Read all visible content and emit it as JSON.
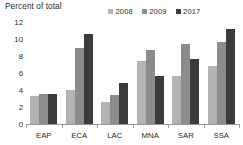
{
  "chart_data": {
    "type": "bar",
    "title": "",
    "ylabel": "Percent of total",
    "xlabel": "",
    "ylim": [
      0,
      12
    ],
    "yticks": [
      0,
      2,
      4,
      6,
      8,
      10,
      12
    ],
    "grid": false,
    "legend_position": "top-right",
    "categories": [
      "EAP",
      "ECA",
      "LAC",
      "MNA",
      "SAR",
      "SSA"
    ],
    "series": [
      {
        "name": "2008",
        "color": "#b3b3b3",
        "values": [
          3.3,
          4.0,
          2.6,
          7.4,
          5.7,
          6.8
        ]
      },
      {
        "name": "2009",
        "color": "#8c8c8c",
        "values": [
          3.5,
          8.9,
          3.4,
          8.7,
          9.4,
          9.6
        ]
      },
      {
        "name": "2017",
        "color": "#3b3b3b",
        "values": [
          3.5,
          10.6,
          4.8,
          5.7,
          7.7,
          11.2
        ]
      }
    ]
  },
  "colors": {
    "axis": "#9a9a9a",
    "text": "#2b2b2b",
    "background": "#ffffff"
  }
}
